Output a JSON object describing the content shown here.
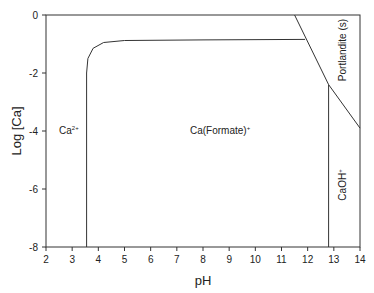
{
  "chart_data": {
    "type": "line",
    "title": "",
    "xlabel": "pH",
    "ylabel": "Log [Ca]",
    "xlim": [
      2,
      14
    ],
    "ylim": [
      -8,
      0
    ],
    "xticks": [
      2,
      3,
      4,
      5,
      6,
      7,
      8,
      9,
      10,
      11,
      12,
      13,
      14
    ],
    "yticks": [
      0,
      -2,
      -4,
      -6,
      -8
    ],
    "grid": false,
    "series": [
      {
        "name": "Ca2+/Ca(Formate)+ boundary",
        "x": [
          3.55,
          3.55,
          3.6,
          3.8,
          4.2,
          5.0,
          8.0,
          11.9
        ],
        "y": [
          -8,
          -2.0,
          -1.5,
          -1.15,
          -0.95,
          -0.88,
          -0.86,
          -0.84
        ]
      },
      {
        "name": "Portlandite solubility",
        "x": [
          11.5,
          12.8,
          14.0
        ],
        "y": [
          0,
          -2.4,
          -3.9
        ]
      },
      {
        "name": "Ca(Formate)+/CaOH+ boundary",
        "x": [
          12.8,
          12.8
        ],
        "y": [
          -8,
          -2.4
        ]
      }
    ],
    "annotations": [
      {
        "text": "Ca",
        "sup": "2+",
        "x": 2.6,
        "y": -4.0
      },
      {
        "text": "Ca(Formate)",
        "sup": "+",
        "x": 7.9,
        "y": -4.0
      },
      {
        "text": "Portlandite (s)",
        "x": 13.6,
        "y": -1.5,
        "rotation": -90
      },
      {
        "text": "CaOH",
        "sup": "+",
        "x": 13.5,
        "y": -5.2,
        "rotation": -90
      }
    ]
  },
  "labels": {
    "xlabel": "pH",
    "ylabel": "Log [Ca]",
    "ca2": "Ca",
    "ca2_sup": "2+",
    "caformate": "Ca(Formate)",
    "caformate_sup": "+",
    "portlandite": "Portlandite (s)",
    "caoh": "CaOH",
    "caoh_sup": "+"
  }
}
